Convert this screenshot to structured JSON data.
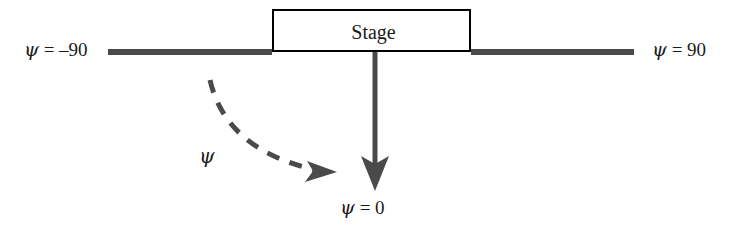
{
  "figure": {
    "type": "diagram",
    "background_color": "#ffffff"
  },
  "stage": {
    "label": "Stage",
    "border_color": "#000000",
    "fill_color": "#ffffff"
  },
  "axis": {
    "line_color": "#4a4a4a",
    "left_label": "ψ = –90",
    "left_label_symbol": "ψ",
    "left_label_text": "= –90",
    "right_label": "ψ = 90",
    "right_label_symbol": "ψ",
    "right_label_text": "= 90"
  },
  "center_arrow": {
    "label": "ψ = 0",
    "label_symbol": "ψ",
    "label_text": "= 0",
    "color": "#4a4a4a",
    "style": "solid"
  },
  "angle_arrow": {
    "label": "ψ",
    "color": "#4a4a4a",
    "style": "dashed"
  }
}
